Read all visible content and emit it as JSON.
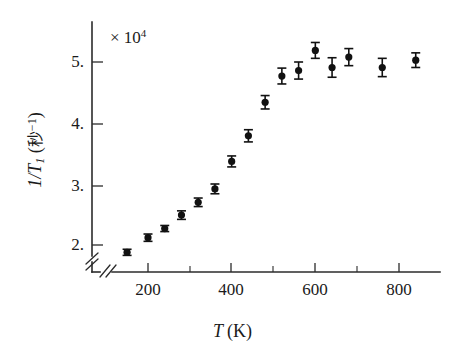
{
  "chart_data": {
    "type": "scatter",
    "title": "",
    "subtitle": "",
    "xlabel": "T (K)",
    "ylabel": "1/T1 (秒⁻¹)",
    "scale_annotation": "× 10⁴",
    "scale_multiplier": 10000,
    "grid": false,
    "legend": null,
    "xlim": [
      100,
      880
    ],
    "ylim": [
      1.7,
      5.55
    ],
    "axis_break": {
      "x_axis": true,
      "y_axis": true,
      "note": "double-slash break marks near origin on both axes"
    },
    "xticks": [
      200,
      400,
      600,
      800
    ],
    "xtick_labels": [
      "200",
      "400",
      "600",
      "800"
    ],
    "xminor_ticks": [
      300,
      500,
      700
    ],
    "yticks": [
      2,
      3,
      4,
      5
    ],
    "ytick_labels": [
      "2.",
      "3.",
      "4.",
      "5."
    ],
    "x": [
      150,
      200,
      240,
      280,
      320,
      360,
      400,
      440,
      480,
      520,
      560,
      600,
      640,
      680,
      760,
      840
    ],
    "y": [
      1.88,
      2.12,
      2.27,
      2.49,
      2.7,
      2.92,
      3.37,
      3.79,
      4.34,
      4.77,
      4.86,
      5.19,
      4.91,
      5.08,
      4.91,
      5.03
    ],
    "yerr": [
      0.05,
      0.06,
      0.05,
      0.07,
      0.07,
      0.08,
      0.09,
      0.1,
      0.11,
      0.13,
      0.14,
      0.13,
      0.16,
      0.14,
      0.15,
      0.12
    ],
    "series": [
      {
        "name": "1/T1 vs T",
        "marker": "filled-circle",
        "color": "#111111",
        "values": [
          1.88,
          2.12,
          2.27,
          2.49,
          2.7,
          2.92,
          3.37,
          3.79,
          4.34,
          4.77,
          4.86,
          5.19,
          4.91,
          5.08,
          4.91,
          5.03
        ]
      }
    ]
  },
  "axes": {
    "x_title_symbol": "T",
    "x_title_unit": "(K)",
    "y_title_prefix": "1/",
    "y_title_symbol": "T",
    "y_title_subscript": "1",
    "y_title_open": " (",
    "y_title_cjk": "秒",
    "y_title_sup": "−1",
    "y_title_close": ")",
    "scale_base": "× 10",
    "scale_exponent": "4"
  },
  "colors": {
    "axis": "#2b2b2b",
    "marker": "#111111",
    "background": "#ffffff",
    "text": "#1a1a1a"
  }
}
